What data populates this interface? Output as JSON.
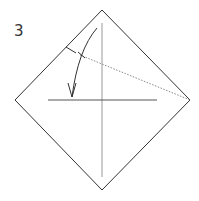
{
  "diagram": {
    "step_number": "3",
    "colors": {
      "outline": "#333333",
      "crease": "#999999",
      "valley_fold": "#777777",
      "arrow": "#333333"
    }
  }
}
